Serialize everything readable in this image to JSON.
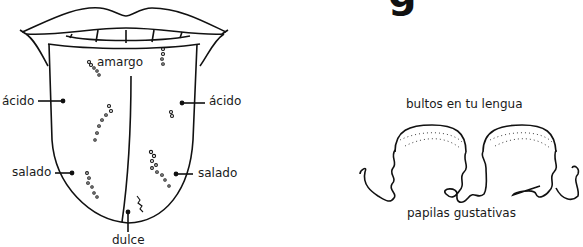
{
  "heading": {
    "visible_fragment": "g"
  },
  "tongue_diagram": {
    "labels": {
      "top": "amargo",
      "left_upper": "ácido",
      "right_upper": "ácido",
      "left_lower": "salado",
      "right_lower": "salado",
      "bottom": "dulce"
    }
  },
  "papillae_diagram": {
    "top_label": "bultos en tu lengua",
    "bottom_label": "papilas gustativas"
  }
}
